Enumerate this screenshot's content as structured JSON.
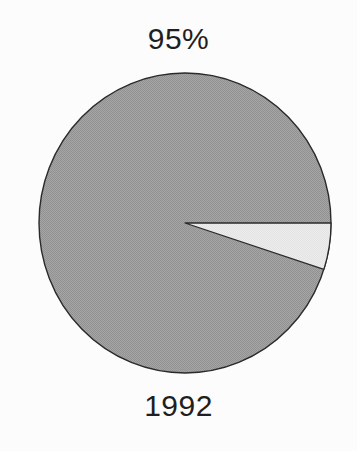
{
  "chart_data": {
    "type": "pie",
    "title": "95%",
    "xlabel": "1992",
    "categories": [
      "major",
      "minor"
    ],
    "values": [
      95,
      5
    ],
    "slices": [
      {
        "name": "major",
        "value": 95,
        "color": "#9b9b9b"
      },
      {
        "name": "minor",
        "value": 5,
        "color": "#e9e9e9"
      }
    ],
    "start_angle_deg": 0,
    "direction": "clockwise",
    "outline_color": "#2a2a2a",
    "background_color": "#fcfcfc",
    "legend": "none",
    "grid": false
  }
}
